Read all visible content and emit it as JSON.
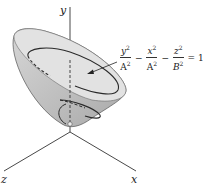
{
  "figure": {
    "type": "hyperboloid-of-two-sheets",
    "axes": {
      "x_label": "x",
      "y_label": "y",
      "z_label": "z"
    },
    "equation": {
      "terms": [
        {
          "num": "y",
          "num_exp": "2",
          "den": "A",
          "den_exp": "2"
        },
        {
          "num": "x",
          "num_exp": "2",
          "den": "A",
          "den_exp": "2"
        },
        {
          "num": "z",
          "num_exp": "2",
          "den": "B",
          "den_exp": "2"
        }
      ],
      "op1": "−",
      "op2": "−",
      "equals": "= 1"
    },
    "colors": {
      "surface_fill": "#c9c9c9",
      "surface_inner": "#dcdcdc",
      "outline": "#3a3a3a",
      "axis": "#333333"
    }
  }
}
